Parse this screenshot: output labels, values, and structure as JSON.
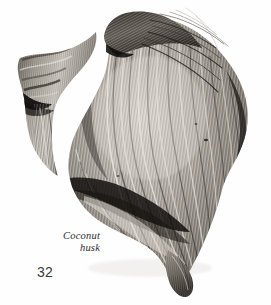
{
  "page": {
    "background_color": "#fefefe",
    "width": 271,
    "height": 305
  },
  "margin_rule": {
    "color": "#b9b9b9"
  },
  "caption": {
    "line1": "Coconut",
    "line2": "husk",
    "full_text": "Coconut husk",
    "color": "#2c2c2c",
    "alignment": "right",
    "style": "italic-serif"
  },
  "folio": {
    "page_number": "32",
    "color": "#3a3a3a"
  },
  "photo": {
    "subject": "coconut-husk",
    "description": "Grayscale photograph of a dried fibrous coconut husk with a curled left lobe, a dark tuft of fibres at the top, and long radiating striations sweeping down to a pointed tip at lower right.",
    "palette": {
      "highlight": "#e8e5e0",
      "light": "#cfcac3",
      "mid": "#9d978e",
      "dark": "#55504a",
      "shadow": "#241f1c",
      "deep_shadow": "#0c0a09"
    }
  }
}
